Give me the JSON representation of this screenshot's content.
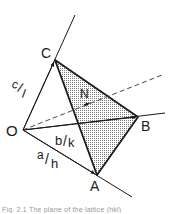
{
  "diagram": {
    "type": "lattice-plane-intercepts",
    "points": {
      "origin": {
        "label": "O"
      },
      "a_intercept": {
        "label": "A"
      },
      "b_intercept": {
        "label": "B"
      },
      "c_intercept": {
        "label": "C"
      },
      "normal": {
        "label": "N"
      }
    },
    "vectors": {
      "oa": {
        "label_num": "a",
        "label_den": "h"
      },
      "ob": {
        "label_num": "b",
        "label_den": "k"
      },
      "oc": {
        "label_num": "c",
        "label_den": "l"
      }
    },
    "colors": {
      "line": "#1a1a1a",
      "plane_fill": "#d8d8d8",
      "dashed": "#333333"
    }
  },
  "caption": "Fig. 2.1  The plane of the lattice (hkl)"
}
